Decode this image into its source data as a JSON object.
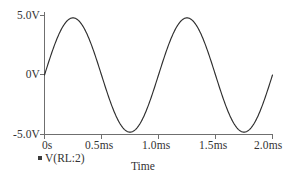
{
  "chart_data": {
    "type": "line",
    "title": "",
    "xlabel": "Time",
    "ylabel": "",
    "xlim": [
      0,
      2.0
    ],
    "ylim": [
      -5.0,
      5.0
    ],
    "grid": false,
    "legend_position": "bottom-left",
    "x_unit": "ms",
    "y_unit": "V",
    "x_tick_values": [
      0,
      0.5,
      1.0,
      1.5,
      2.0
    ],
    "x_tick_labels": [
      "0s",
      "0.5ms",
      "1.0ms",
      "1.5ms",
      "2.0ms"
    ],
    "y_tick_values": [
      5.0,
      0,
      -5.0
    ],
    "y_tick_labels": [
      "5.0V",
      "0V",
      "-5.0V"
    ],
    "series": [
      {
        "name": "V(RL:2)",
        "color": "#2e2e2e",
        "waveform": "sine",
        "amplitude": 4.8,
        "period_ms": 1.0,
        "phase": 0,
        "offset": 0,
        "x": [
          0,
          0.05,
          0.1,
          0.15,
          0.2,
          0.25,
          0.3,
          0.35,
          0.4,
          0.45,
          0.5,
          0.55,
          0.6,
          0.65,
          0.7,
          0.75,
          0.8,
          0.85,
          0.9,
          0.95,
          1.0,
          1.05,
          1.1,
          1.15,
          1.2,
          1.25,
          1.3,
          1.35,
          1.4,
          1.45,
          1.5,
          1.55,
          1.6,
          1.65,
          1.7,
          1.75,
          1.8,
          1.85,
          1.9,
          1.95,
          2.0
        ],
        "values": [
          0,
          1.48,
          2.82,
          3.88,
          4.56,
          4.8,
          4.56,
          3.88,
          2.82,
          1.48,
          0,
          -1.48,
          -2.82,
          -3.88,
          -4.56,
          -4.8,
          -4.56,
          -3.88,
          -2.82,
          -1.48,
          0,
          1.48,
          2.82,
          3.88,
          4.56,
          4.8,
          4.56,
          3.88,
          2.82,
          1.48,
          0,
          -1.48,
          -2.82,
          -3.88,
          -4.56,
          -4.8,
          -4.56,
          -3.88,
          -2.82,
          -1.48,
          0
        ]
      }
    ]
  },
  "y_labels": {
    "top": "5.0V",
    "mid": "0V",
    "bottom": "-5.0V"
  },
  "x_labels": {
    "t0": "0s",
    "t1": "0.5ms",
    "t2": "1.0ms",
    "t3": "1.5ms",
    "t4": "2.0ms"
  },
  "axis_title": {
    "x": "Time"
  },
  "legend": {
    "trace_label": "V(RL:2)",
    "swatch_color": "#3b3b3b"
  }
}
